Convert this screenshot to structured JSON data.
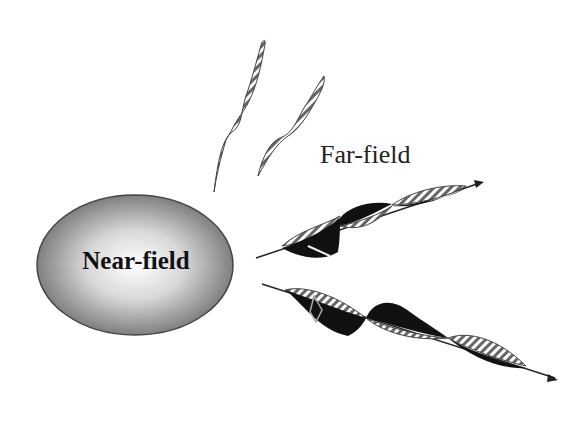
{
  "diagram": {
    "near_field": {
      "label": "Near-field",
      "shape": "ellipse-gradient"
    },
    "far_field": {
      "label": "Far-field"
    },
    "waves": [
      {
        "name": "upper-left-wave",
        "style": "hatched",
        "direction": "up"
      },
      {
        "name": "upper-right-wave",
        "style": "hatched",
        "direction": "up"
      },
      {
        "name": "far-wave-1",
        "style": "hatched-and-black",
        "direction": "right-up",
        "arrow": true
      },
      {
        "name": "far-wave-2",
        "style": "hatched-and-black",
        "direction": "right-down",
        "arrow": true
      }
    ],
    "colors": {
      "ellipse_edge": "#6e6e6e",
      "ellipse_center": "#ffffff",
      "wave_dark": "#111111",
      "hatch": "#555555"
    }
  }
}
